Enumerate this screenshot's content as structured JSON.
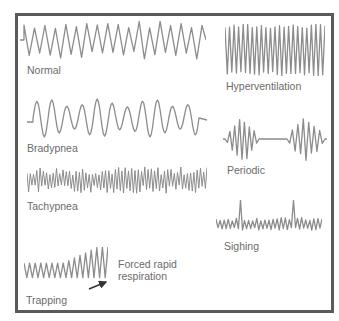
{
  "figure": {
    "stroke_color": "#8c8c8c",
    "border_color": "#5a5a5a",
    "text_color": "#6b6b6b"
  },
  "patterns": [
    {
      "id": "normal",
      "label": "Normal",
      "box": {
        "x": 20,
        "y": 20,
        "w": 186,
        "h": 40
      },
      "label_pos": {
        "x": 27,
        "y": 64
      }
    },
    {
      "id": "hyperventilation",
      "label": "Hyperventilation",
      "box": {
        "x": 225,
        "y": 24,
        "w": 100,
        "h": 52
      },
      "label_pos": {
        "x": 226,
        "y": 80
      }
    },
    {
      "id": "bradypnea",
      "label": "Bradypnea",
      "box": {
        "x": 27,
        "y": 98,
        "w": 180,
        "h": 40
      },
      "label_pos": {
        "x": 27,
        "y": 142
      }
    },
    {
      "id": "periodic",
      "label": "Periodic",
      "box": {
        "x": 223,
        "y": 117,
        "w": 104,
        "h": 44
      },
      "label_pos": {
        "x": 227,
        "y": 164
      }
    },
    {
      "id": "tachypnea",
      "label": "Tachypnea",
      "box": {
        "x": 27,
        "y": 166,
        "w": 180,
        "h": 28
      },
      "label_pos": {
        "x": 27,
        "y": 200
      }
    },
    {
      "id": "sighing",
      "label": "Sighing",
      "box": {
        "x": 216,
        "y": 200,
        "w": 106,
        "h": 36
      },
      "label_pos": {
        "x": 224,
        "y": 240
      }
    },
    {
      "id": "trapping",
      "label": "Trapping",
      "box": {
        "x": 24,
        "y": 247,
        "w": 84,
        "h": 36
      },
      "label_pos": {
        "x": 26,
        "y": 294
      }
    }
  ],
  "annotation": {
    "label": "Forced rapid respiration",
    "label_pos": {
      "x": 118,
      "y": 258
    },
    "arrow": {
      "x1": 89,
      "y1": 289,
      "x2": 106,
      "y2": 282
    }
  }
}
